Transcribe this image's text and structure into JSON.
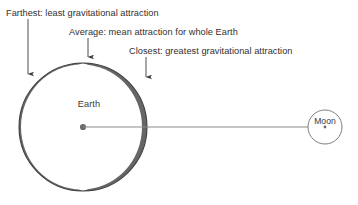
{
  "diagram": {
    "background_color": "#ffffff",
    "annotations": [
      {
        "id": "farthest",
        "label": "Farthest: least gravitational attraction",
        "text_x": 6,
        "text_y": 16,
        "arrow_x": 28,
        "arrow_y_start": 19,
        "arrow_y_end": 74,
        "arrow_name": "down-arrow-icon"
      },
      {
        "id": "average",
        "label": "Average: mean attraction for whole Earth",
        "text_x": 69,
        "text_y": 35,
        "arrow_x": 88,
        "arrow_y_start": 38,
        "arrow_y_end": 57,
        "arrow_name": "down-arrow-icon"
      },
      {
        "id": "closest",
        "label": "Closest: greatest gravitational attraction",
        "text_x": 129,
        "text_y": 54,
        "arrow_x": 146,
        "arrow_y_start": 57,
        "arrow_y_end": 77,
        "arrow_name": "down-arrow-icon"
      }
    ],
    "earth": {
      "label": "Earth",
      "label_x": 89,
      "label_y": 107,
      "center_x": 83,
      "center_y": 127,
      "radius": 64,
      "outline_color": "#3c3c3c",
      "shade_color": "#6b6b6b",
      "center_dot_color": "#6b6b6b",
      "center_dot_radius": 3.1
    },
    "moon": {
      "label": "Moon",
      "label_x": 325,
      "label_y": 124,
      "center_x": 325,
      "center_y": 127,
      "radius": 17,
      "outline_color": "#777777",
      "center_dot_color": "#6b6b6b",
      "center_dot_radius": 1.4
    },
    "connector": {
      "name": "earth-moon-distance-line",
      "x1": 83,
      "y1": 127,
      "x2": 325,
      "y2": 127,
      "color": "#8a8a8a"
    }
  }
}
